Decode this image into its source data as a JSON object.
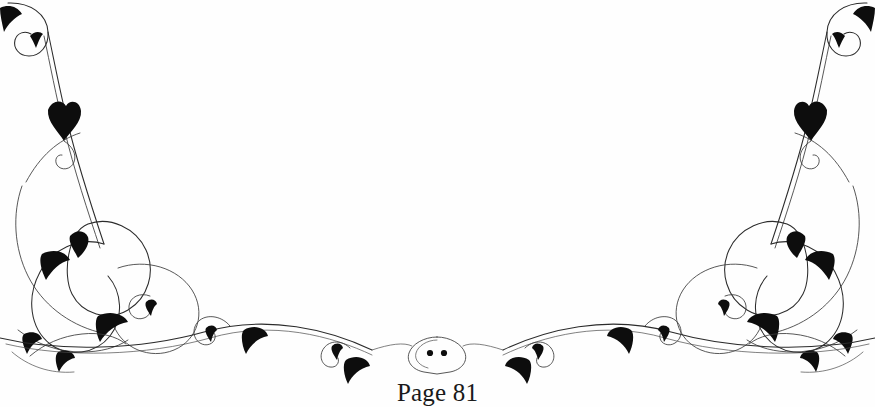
{
  "page": {
    "background_color": "#fefefe",
    "ink_color": "#1a1a1a",
    "width": 875,
    "height": 407
  },
  "ornament": {
    "name": "symmetric-calligraphic-flourish",
    "description": "Mirrored scrollwork border ornament with hairline curves and solid black teardrop leaves",
    "center_medallion_dots": 2,
    "ink_color": "#2b2b2b",
    "leaf_color": "#0d0d0d"
  },
  "footer": {
    "page_label": "Page 81"
  }
}
